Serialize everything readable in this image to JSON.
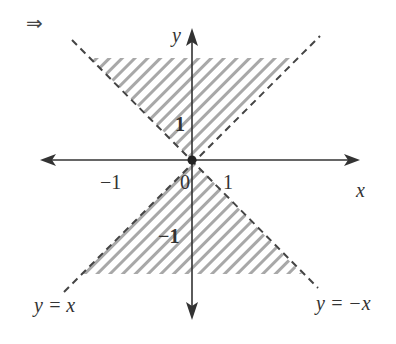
{
  "diagram": {
    "implication_symbol": "⇒",
    "axes": {
      "x_label": "x",
      "y_label": "y",
      "origin_label": "0"
    },
    "ticks": {
      "x_neg": "−1",
      "x_pos": "1",
      "y_pos": "1",
      "y_neg": "−1"
    },
    "lines": [
      {
        "id": "line-y-eq-x",
        "label": "y = x",
        "style": "dashed"
      },
      {
        "id": "line-y-eq-neg-x",
        "label": "y = −x",
        "style": "dashed"
      }
    ],
    "regions": [
      {
        "id": "upper-region",
        "description": "hatched region above origin between y=x and y=-x (|y| >= |x|, y > 0)"
      },
      {
        "id": "lower-region",
        "description": "hatched region below origin between y=x and y=-x (|y| >= |x|, y < 0)"
      }
    ],
    "origin_point": "closed dot at (0,0)",
    "colors": {
      "axis": "#333333",
      "dash": "#444444",
      "hatch": "#a8a8a8",
      "text": "#333333"
    }
  }
}
